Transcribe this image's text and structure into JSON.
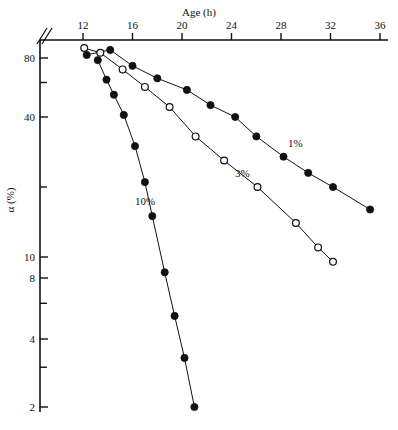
{
  "chart_data": {
    "type": "scatter",
    "title": "",
    "xlabel": "Age (h)",
    "ylabel": "α (%)",
    "xlim": [
      10.5,
      36
    ],
    "ylim": [
      2,
      90
    ],
    "yscale": "log-probability",
    "grid": false,
    "legend_position": "inline-annotations",
    "xticks": [
      12,
      16,
      20,
      24,
      28,
      32,
      36
    ],
    "xticklabels": [
      "12",
      "16",
      "20",
      "24",
      "28",
      "32",
      "36"
    ],
    "yticks": [
      80,
      40,
      10,
      8,
      4,
      2
    ],
    "yticklabels": [
      "80",
      "40",
      "10",
      "8",
      "4",
      "2"
    ],
    "y_minor_ticks": [
      60,
      20,
      6,
      3
    ],
    "axis_break": "y-axis top break",
    "series": [
      {
        "name": "1%",
        "label": "1%",
        "marker": "filled-circle",
        "points": [
          {
            "x": 12.3,
            "y": 83
          },
          {
            "x": 14.2,
            "y": 88
          },
          {
            "x": 16.0,
            "y": 73
          },
          {
            "x": 18.0,
            "y": 63
          },
          {
            "x": 20.4,
            "y": 55
          },
          {
            "x": 22.3,
            "y": 46
          },
          {
            "x": 24.3,
            "y": 40
          },
          {
            "x": 26.0,
            "y": 33
          },
          {
            "x": 28.2,
            "y": 27
          },
          {
            "x": 30.2,
            "y": 23
          },
          {
            "x": 32.2,
            "y": 20
          },
          {
            "x": 35.2,
            "y": 16
          }
        ]
      },
      {
        "name": "3%",
        "label": "3%",
        "marker": "open-circle",
        "points": [
          {
            "x": 12.1,
            "y": 90
          },
          {
            "x": 13.4,
            "y": 85
          },
          {
            "x": 15.2,
            "y": 70
          },
          {
            "x": 17.0,
            "y": 57
          },
          {
            "x": 19.0,
            "y": 45
          },
          {
            "x": 21.1,
            "y": 33
          },
          {
            "x": 23.4,
            "y": 26
          },
          {
            "x": 26.1,
            "y": 20
          },
          {
            "x": 29.2,
            "y": 14
          },
          {
            "x": 31.0,
            "y": 11
          },
          {
            "x": 32.2,
            "y": 9.5
          }
        ]
      },
      {
        "name": "10%",
        "label": "10%",
        "marker": "filled-circle",
        "points": [
          {
            "x": 13.2,
            "y": 78
          },
          {
            "x": 13.9,
            "y": 62
          },
          {
            "x": 14.5,
            "y": 52
          },
          {
            "x": 15.3,
            "y": 41
          },
          {
            "x": 16.2,
            "y": 30
          },
          {
            "x": 17.0,
            "y": 21
          },
          {
            "x": 17.6,
            "y": 15
          },
          {
            "x": 18.6,
            "y": 8.5
          },
          {
            "x": 19.4,
            "y": 5.2
          },
          {
            "x": 20.2,
            "y": 3.3
          },
          {
            "x": 21.0,
            "y": 2.0
          }
        ]
      }
    ]
  }
}
